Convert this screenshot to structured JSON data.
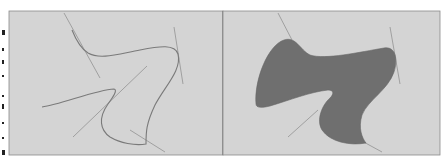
{
  "figure": {
    "panels": [
      {
        "id": "outline",
        "label": "",
        "style": "stroked outline with tangent handles"
      },
      {
        "id": "filled",
        "label": "",
        "style": "filled shape with tangent handles"
      }
    ],
    "colors": {
      "page": "#ffffff",
      "panel_background": "#d4d4d4",
      "panel_border": "#8a8a8a",
      "divider": "#6e6e6e",
      "curve_stroke": "#7a7a7a",
      "handle_stroke": "#9a9a9a",
      "shape_fill": "#6f6f6f"
    }
  }
}
